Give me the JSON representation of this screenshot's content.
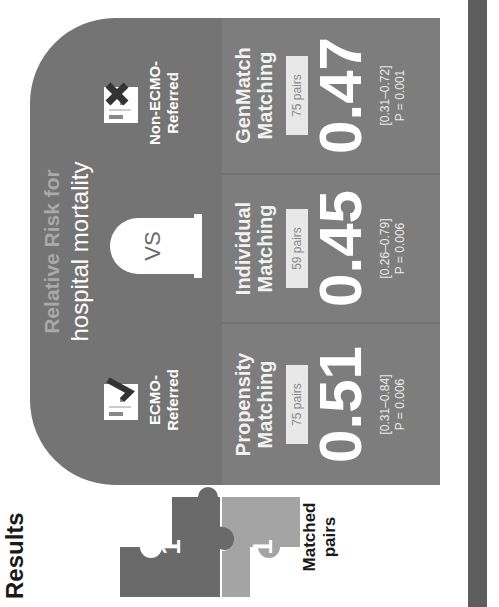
{
  "section_title": "Results",
  "matched_pairs_label": "Matched pairs",
  "puzzle": {
    "left_number": "1",
    "right_number": "1",
    "left_color": "#6a6a6a",
    "right_color": "#a4a4a4"
  },
  "panel": {
    "title_line1": "Relative Risk for",
    "title_line2": "hospital mortality",
    "vs_label": "VS",
    "background_color": "#747474",
    "groups": [
      {
        "label_line1": "ECMO-",
        "label_line2": "Referred",
        "icon": "check-document-icon"
      },
      {
        "label_line1": "Non-ECMO-",
        "label_line2": "Referred",
        "icon": "x-document-icon"
      }
    ],
    "cards": [
      {
        "method_line1": "Propensity",
        "method_line2": "Matching",
        "pairs": "75 pairs",
        "rr": "0.51",
        "ci": "[0.31–0.84]",
        "p": "P = 0.006"
      },
      {
        "method_line1": "Individual",
        "method_line2": "Matching",
        "pairs": "59 pairs",
        "rr": "0.45",
        "ci": "[0.26–0.79]",
        "p": "P = 0.006"
      },
      {
        "method_line1": "GenMatch",
        "method_line2": "Matching",
        "pairs": "75 pairs",
        "rr": "0.47",
        "ci": "[0.31–0.72]",
        "p": "P = 0.001"
      }
    ]
  },
  "bar_color": "#5e5e5e"
}
